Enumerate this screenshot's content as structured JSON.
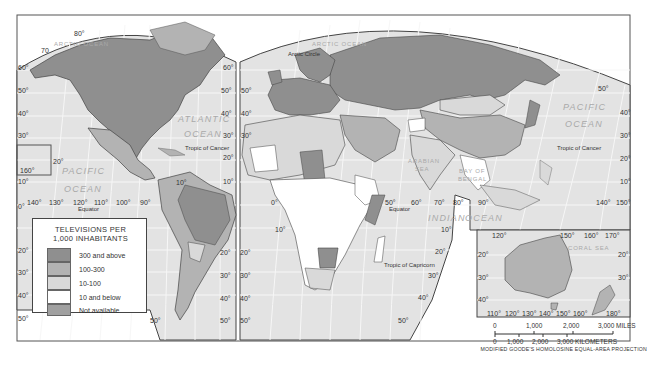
{
  "map": {
    "title": "TELEVISIONS PER 1,000 INHABITANTS",
    "projection": "MODIFIED GOODE'S HOMOLOSINE EQUAL-AREA PROJECTION",
    "oceans": [
      {
        "id": "arctic-west",
        "label": "ARCTIC OCEAN"
      },
      {
        "id": "arctic-east",
        "label": "ARCTIC OCEAN"
      },
      {
        "id": "atlantic-1",
        "label": "ATLANTIC"
      },
      {
        "id": "atlantic-2",
        "label": "OCEAN"
      },
      {
        "id": "pacific-west-1",
        "label": "PACIFIC"
      },
      {
        "id": "pacific-west-2",
        "label": "OCEAN"
      },
      {
        "id": "pacific-east-1",
        "label": "PACIFIC"
      },
      {
        "id": "pacific-east-2",
        "label": "OCEAN"
      },
      {
        "id": "indian-1",
        "label": "INDIAN"
      },
      {
        "id": "indian-2",
        "label": "OCEAN"
      },
      {
        "id": "arabian-1",
        "label": "ARABIAN"
      },
      {
        "id": "arabian-2",
        "label": "SEA"
      },
      {
        "id": "bengal-1",
        "label": "BAY OF"
      },
      {
        "id": "bengal-2",
        "label": "BENGAL"
      },
      {
        "id": "coral",
        "label": "CORAL SEA"
      }
    ],
    "lines": {
      "arctic_circle": "Arctic Circle",
      "tropic_cancer_w": "Tropic of Cancer",
      "tropic_cancer_e": "Tropic of Cancer",
      "equator_w": "Equator",
      "equator_e": "Equator",
      "tropic_capricorn": "Tropic of Capricorn"
    },
    "degrees": {
      "nw_top": "80°",
      "nw_70": "70",
      "w_60": "60°",
      "w_50": "50°",
      "w_40": "40°",
      "w_30": "30°",
      "w_20": "20°",
      "w_10": "10°",
      "w_0": "0°",
      "hawaii_20": "20°",
      "hawaii_160": "160°",
      "lon_140": "140°",
      "lon_130": "130°",
      "lon_120": "120°",
      "lon_110": "110°",
      "lon_100": "100°",
      "lon_90": "90°",
      "mid_60": "60°",
      "mid_50": "50°",
      "mid_40": "40°",
      "mid_30": "30°",
      "mid_20": "20°",
      "mid_10": "10°",
      "e_60": "60°",
      "e_50": "50°",
      "e_40": "40°",
      "e_30": "30°",
      "e_20": "20°",
      "e_10": "10°",
      "sa_10": "10°",
      "sa_50": "50°",
      "sa_0": "0°",
      "s_20a": "20°",
      "s_20b": "20°",
      "s_30a": "30°",
      "s_30b": "30°",
      "s_40a": "40°",
      "s_40b": "40°",
      "s_50a": "50°",
      "s_50b": "50°",
      "af_0": "0°",
      "af_10": "10°",
      "ind_50": "50°",
      "ind_60": "60°",
      "ind_70": "70°",
      "ind_80": "80°",
      "ind_90": "90°",
      "ind_s10": "10°",
      "ind_s20": "20°",
      "ind_s30": "30°",
      "ind_s40": "40°",
      "ind_s50": "50°",
      "pac_50": "50°",
      "pac_40": "40°",
      "pac_30": "30°",
      "pac_20": "20°",
      "pac_10": "10°",
      "pac_140": "140°",
      "pac_150": "150°",
      "aus_120": "120°",
      "aus_150": "150°",
      "aus_160": "160°",
      "aus_170": "170°",
      "aus_20l": "20°",
      "aus_30l": "30°",
      "aus_40l": "40°",
      "aus_20r": "20°",
      "aus_30r": "30°",
      "aus_b110": "110°",
      "aus_b120": "120°",
      "aus_b130": "130°",
      "aus_b140": "140°",
      "aus_b150": "150°",
      "aus_b160": "160°",
      "aus_b180": "180°"
    }
  },
  "legend": {
    "title_line1": "TELEVISIONS PER",
    "title_line2": "1,000 INHABITANTS",
    "items": [
      {
        "label": "300 and above",
        "color": "#8f8f8f"
      },
      {
        "label": "100-300",
        "color": "#b3b3b3"
      },
      {
        "label": "10-100",
        "color": "#d9d9d9"
      },
      {
        "label": "10 and below",
        "color": "#ffffff"
      },
      {
        "label": "Not available",
        "color": "#a0a0a0"
      }
    ]
  },
  "scale": {
    "miles": [
      "0",
      "1,000",
      "2,000",
      "3,000 MILES"
    ],
    "kilometers": [
      "0",
      "1,000",
      "2,000",
      "3,000 KILOMETERS"
    ]
  },
  "colors": {
    "ocean": "#e3e3e3",
    "graticule": "#f7f7f7",
    "border": "#444444",
    "high": "#8f8f8f",
    "mid": "#b3b3b3",
    "low": "#d9d9d9",
    "lowest": "#ffffff"
  }
}
